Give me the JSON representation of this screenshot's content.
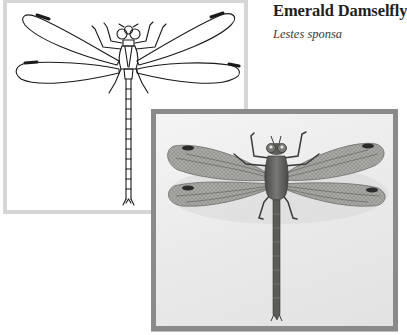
{
  "species": {
    "common_name": "Emerald Damselfly",
    "scientific_name": "Lestes sponsa"
  },
  "figures": {
    "line_drawing": {
      "icon": "damselfly-line-drawing",
      "border_color": "#d6d6d6"
    },
    "photograph": {
      "icon": "damselfly-photograph",
      "border_color": "#8a8a8a"
    }
  }
}
